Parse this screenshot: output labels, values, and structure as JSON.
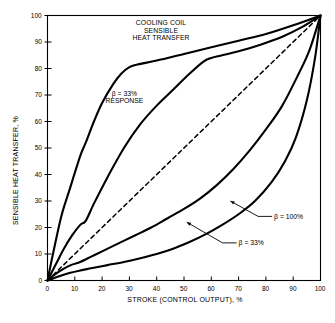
{
  "chart_data": {
    "type": "line",
    "title": "COOLING COIL SENSIBLE HEAT TRANSFER",
    "title_lines": [
      "COOLING COIL",
      "SENSIBLE",
      "HEAT TRANSFER"
    ],
    "xlabel": "STROKE (CONTROL OUTPUT), %",
    "ylabel": "SENSIBLE HEAT TRANSFER, %",
    "xlim": [
      0,
      100
    ],
    "ylim": [
      0,
      100
    ],
    "xticks": [
      0,
      10,
      20,
      30,
      40,
      50,
      60,
      70,
      80,
      90,
      100
    ],
    "yticks": [
      0,
      10,
      20,
      30,
      40,
      50,
      60,
      70,
      80,
      90,
      100
    ],
    "xticklabels": [
      "0",
      "10",
      "20",
      "30",
      "40",
      "50",
      "60",
      "70",
      "80",
      "90",
      "100"
    ],
    "yticklabels": [
      "0",
      "10",
      "20",
      "30",
      "40",
      "50",
      "60",
      "70",
      "80",
      "90",
      "100"
    ],
    "grid": false,
    "legend": "none",
    "line_color": "#000000",
    "background": "#ffffff",
    "series": [
      {
        "name": "beta = 33% response (fast coil)",
        "style": "solid",
        "x": [
          0,
          2,
          5,
          8,
          12,
          14,
          17,
          20,
          24,
          27,
          30,
          33,
          40,
          50,
          60,
          70,
          80,
          90,
          100
        ],
        "y": [
          0,
          10,
          24,
          34,
          47,
          52,
          60,
          67,
          74,
          78,
          80.5,
          81.5,
          83,
          85.5,
          88,
          90.5,
          93,
          96.3,
          100
        ]
      },
      {
        "name": "beta = 33% response (second curve)",
        "style": "solid",
        "x": [
          0,
          3,
          6,
          9,
          12,
          14,
          17,
          22,
          28,
          34,
          40,
          46,
          52,
          57,
          60,
          64,
          70,
          78,
          86,
          93,
          100
        ],
        "y": [
          0,
          6,
          12,
          17,
          21,
          22.5,
          29,
          39,
          50,
          59,
          66,
          72,
          78,
          82.5,
          84,
          85,
          86.5,
          89,
          92,
          95.5,
          100
        ]
      },
      {
        "name": "linear reference",
        "style": "dashed",
        "x": [
          0,
          100
        ],
        "y": [
          0,
          100
        ]
      },
      {
        "name": "beta = 33%",
        "style": "solid",
        "x": [
          0,
          3,
          6,
          9,
          12,
          16,
          20,
          26,
          32,
          38,
          44,
          50,
          56,
          62,
          68,
          74,
          80,
          86,
          92,
          96,
          100
        ],
        "y": [
          0,
          2.5,
          4.5,
          6,
          7,
          9,
          11,
          14,
          17,
          20,
          23.5,
          27,
          31,
          36,
          42,
          49,
          57,
          66,
          78,
          87,
          100
        ]
      },
      {
        "name": "beta = 100%",
        "style": "solid",
        "x": [
          0,
          4,
          8,
          12,
          16,
          22,
          28,
          34,
          40,
          46,
          52,
          58,
          64,
          70,
          76,
          82,
          87,
          91,
          95,
          98,
          100
        ],
        "y": [
          0,
          1.5,
          2.8,
          3.8,
          4.6,
          5.8,
          7,
          8.4,
          10,
          12,
          14.5,
          17.5,
          21,
          25,
          30,
          37,
          45,
          54,
          68,
          84,
          100
        ]
      }
    ],
    "annotations": [
      {
        "name": "beta-33-response-label",
        "text_lines": [
          "β = 33%",
          "RESPONSE"
        ],
        "x": 22,
        "y": 69
      },
      {
        "name": "beta-100-label",
        "text": "β = 100%",
        "x": 83,
        "y": 24,
        "leader_to_x": 67,
        "leader_to_y": 30
      },
      {
        "name": "beta-33-label",
        "text": "β = 33%",
        "x": 70,
        "y": 14,
        "leader_to_x": 51,
        "leader_to_y": 22
      }
    ]
  }
}
